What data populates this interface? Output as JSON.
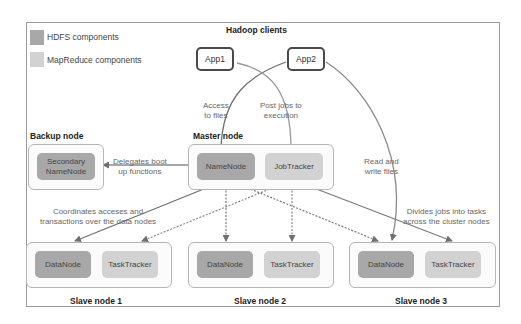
{
  "title": "Hadoop clients",
  "legend": [
    {
      "label": "HDFS components",
      "color": "#a8a8a8"
    },
    {
      "label": "MapReduce components",
      "color": "#d2d2d2"
    }
  ],
  "clients": [
    {
      "label": "App1"
    },
    {
      "label": "App2"
    }
  ],
  "backup_node": {
    "title": "Backup node",
    "component": "Secondary NameNode"
  },
  "master_node": {
    "title": "Master node",
    "components": [
      "NameNode",
      "JobTracker"
    ]
  },
  "slave_nodes": [
    {
      "title": "Slave node 1",
      "components": [
        "DataNode",
        "TaskTracker"
      ]
    },
    {
      "title": "Slave node 2",
      "components": [
        "DataNode",
        "TaskTracker"
      ]
    },
    {
      "title": "Slave node 3",
      "components": [
        "DataNode",
        "TaskTracker"
      ]
    }
  ],
  "edge_labels": {
    "access_files": "Access\nto files",
    "post_jobs": "Post jobs to\nexecution",
    "delegates": "Delegates boot\nup functions",
    "read_write": "Read and\nwrite files",
    "coordinates": "Coordinates acceses and\ntransactions over the data nodes",
    "divides": "Divides jobs into tasks\nacross the cluster nodes"
  },
  "colors": {
    "hdfs": "#a8a8a8",
    "mapreduce": "#d2d2d2",
    "edge": "#7a7a7a"
  }
}
